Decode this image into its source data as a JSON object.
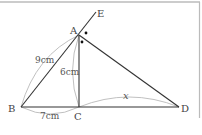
{
  "figure": {
    "type": "geometry-diagram",
    "colors": {
      "line": "#333333",
      "arc": "#aaaaaa",
      "frame": "#bbbbbb",
      "text": "#444444"
    },
    "points": {
      "A": {
        "label": "A",
        "x": 79,
        "y": 35
      },
      "B": {
        "label": "B",
        "x": 21,
        "y": 107
      },
      "C": {
        "label": "C",
        "x": 79,
        "y": 107
      },
      "D": {
        "label": "D",
        "x": 179,
        "y": 107
      },
      "E": {
        "label": "E",
        "x": 96,
        "y": 12
      }
    },
    "segments": [
      {
        "from": "B",
        "to": "E",
        "name": "ray-BA-extended-to-E"
      },
      {
        "from": "A",
        "to": "C",
        "name": "altitude-AC"
      },
      {
        "from": "A",
        "to": "D",
        "name": "segment-AD"
      },
      {
        "from": "B",
        "to": "D",
        "name": "base-BD"
      }
    ],
    "measurements": {
      "AB": "9cm",
      "AC": "6cm",
      "BC": "7cm",
      "CD": "x"
    },
    "angle_marks": {
      "symbol": "•",
      "count": 2,
      "meaning": "angle EAD = angle DAC"
    }
  }
}
